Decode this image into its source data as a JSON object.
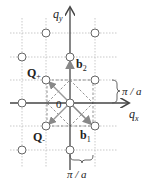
{
  "diagram": {
    "type": "reciprocal-lattice",
    "axes": {
      "x_label": "q",
      "x_sub": "x",
      "y_label": "q",
      "y_sub": "y"
    },
    "origin_label": "0",
    "vectors": {
      "b1": {
        "label": "b",
        "sub": "1"
      },
      "b2": {
        "label": "b",
        "sub": "2"
      },
      "q_plus": {
        "label": "Q",
        "sub": "+"
      },
      "q_minus": {
        "label": "Q",
        "sub": "-"
      }
    },
    "dimension_labels": {
      "right": "π / a",
      "bottom": "π / a"
    },
    "colors": {
      "axis": "#555555",
      "grid": "#bbbbbb",
      "vector": "#888888",
      "dashed_square": "#777777",
      "text": "#222222"
    }
  }
}
